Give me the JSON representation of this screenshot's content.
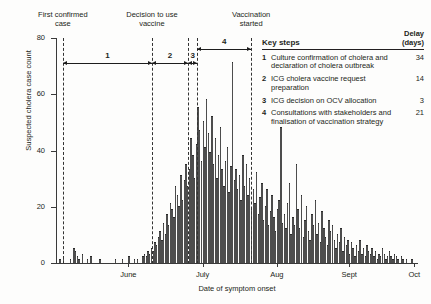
{
  "chart_data": {
    "type": "bar",
    "title": "",
    "xlabel": "Date of symptom onset",
    "ylabel": "Suspected cholera case count",
    "ylim": [
      0,
      80
    ],
    "yticks": [
      0,
      20,
      40,
      60,
      80
    ],
    "grid": false,
    "xtick_labels": [
      "June",
      "July",
      "Aug",
      "Sept",
      "Oct"
    ],
    "xtick_positions_pct": [
      20.0,
      40.5,
      61.0,
      81.0,
      99.0
    ],
    "bar_color": "#4d4d4d",
    "x_description": "Daily suspected cholera case counts by date of symptom onset, late May to early October",
    "values": [
      0,
      0,
      1,
      0,
      2,
      0,
      0,
      0,
      1,
      0,
      5,
      4,
      2,
      1,
      0,
      3,
      0,
      0,
      1,
      0,
      2,
      0,
      0,
      0,
      0,
      1,
      0,
      0,
      0,
      0,
      0,
      0,
      0,
      0,
      1,
      0,
      0,
      0,
      1,
      0,
      0,
      0,
      2,
      0,
      0,
      1,
      0,
      1,
      0,
      0,
      2,
      3,
      2,
      4,
      3,
      5,
      4,
      7,
      6,
      9,
      11,
      8,
      14,
      10,
      17,
      13,
      21,
      19,
      16,
      27,
      24,
      20,
      31,
      22,
      29,
      35,
      27,
      33,
      44,
      38,
      30,
      42,
      55,
      47,
      36,
      50,
      41,
      58,
      46,
      39,
      52,
      35,
      44,
      30,
      38,
      48,
      33,
      27,
      36,
      41,
      25,
      34,
      71,
      29,
      33,
      26,
      31,
      22,
      38,
      27,
      35,
      24,
      30,
      19,
      26,
      21,
      32,
      17,
      23,
      28,
      15,
      20,
      26,
      13,
      18,
      24,
      16,
      11,
      19,
      22,
      48,
      14,
      17,
      12,
      21,
      28,
      10,
      16,
      13,
      35,
      19,
      12,
      24,
      9,
      15,
      20,
      11,
      8,
      17,
      13,
      22,
      10,
      14,
      7,
      18,
      12,
      9,
      6,
      15,
      11,
      13,
      8,
      5,
      10,
      7,
      12,
      4,
      9,
      6,
      8,
      3,
      7,
      5,
      2,
      6,
      4,
      8,
      3,
      5,
      2,
      6,
      4,
      3,
      5,
      2,
      4,
      1,
      3,
      2,
      5,
      3,
      1,
      2,
      4,
      2,
      1,
      3,
      2,
      1,
      0,
      2,
      1,
      0,
      1,
      0,
      0,
      1,
      0,
      0,
      0
    ]
  },
  "events": [
    {
      "id": "first-case",
      "label_line1": "First confirmed",
      "label_line2": "case",
      "x_pct": 1.9
    },
    {
      "id": "decision",
      "label_line1": "Decision to use",
      "label_line2": "vaccine",
      "x_pct": 26.5
    },
    {
      "id": "icg-a",
      "label_line1": "",
      "label_line2": "",
      "x_pct": 36.5
    },
    {
      "id": "icg-b",
      "label_line1": "",
      "label_line2": "",
      "x_pct": 39.0
    },
    {
      "id": "vaccination",
      "label_line1": "Vaccination",
      "label_line2": "started",
      "x_pct": 53.9
    }
  ],
  "timeline": [
    {
      "num": "1",
      "from_pct": 1.9,
      "to_pct": 26.5
    },
    {
      "num": "2",
      "from_pct": 26.5,
      "to_pct": 36.5
    },
    {
      "num": "3",
      "from_pct": 36.5,
      "to_pct": 39.0
    },
    {
      "num": "4",
      "from_pct": 39.0,
      "to_pct": 53.9
    }
  ],
  "key": {
    "title": "Key steps",
    "delay_header_line1": "Delay",
    "delay_header_line2": "(days)",
    "steps": [
      {
        "num": "1",
        "text": "Culture confirmation of cholera and declaration of cholera outbreak",
        "delay": "34"
      },
      {
        "num": "2",
        "text": "ICG cholera vaccine request preparation",
        "delay": "14"
      },
      {
        "num": "3",
        "text": "ICG decision on OCV allocation",
        "delay": "3"
      },
      {
        "num": "4",
        "text": "Consultations with stakeholders and finalisation of vaccination strategy",
        "delay": "21"
      }
    ]
  }
}
